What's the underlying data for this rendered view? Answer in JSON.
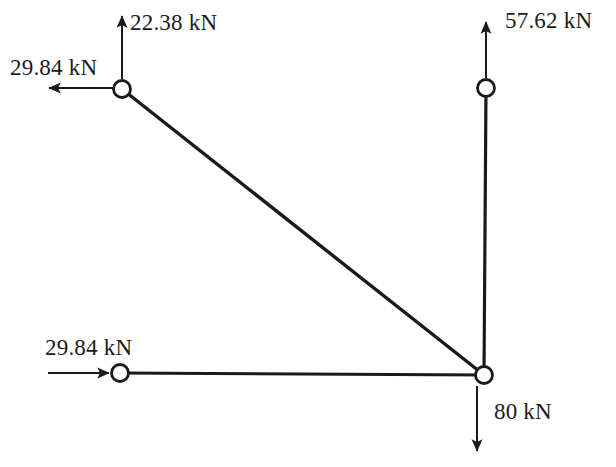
{
  "diagram": {
    "units": "kN",
    "stroke_color": "#1a1a1a",
    "background_color": "#ffffff",
    "nodes": [
      {
        "id": "top-left",
        "label": "top-left joint",
        "x": 122,
        "y": 89,
        "r": 8.5
      },
      {
        "id": "top-right",
        "label": "top-right joint",
        "x": 486,
        "y": 88,
        "r": 8.5
      },
      {
        "id": "bottom-left",
        "label": "bottom-left joint",
        "x": 120,
        "y": 373,
        "r": 8.5
      },
      {
        "id": "bottom-right",
        "label": "bottom-right joint",
        "x": 484,
        "y": 375,
        "r": 8.5
      }
    ],
    "members": [
      {
        "id": "diagonal",
        "from": "top-left",
        "to": "bottom-right"
      },
      {
        "id": "vertical-right",
        "from": "top-right",
        "to": "bottom-right"
      },
      {
        "id": "bottom-chord",
        "from": "bottom-left",
        "to": "bottom-right"
      }
    ],
    "forces": [
      {
        "id": "force-top-left-up",
        "value": "22.38 kN",
        "magnitude": 22.38,
        "direction": "up",
        "at_node": "top-left",
        "label_x": 130,
        "label_y": 30
      },
      {
        "id": "force-top-left-left",
        "value": "29.84 kN",
        "magnitude": 29.84,
        "direction": "left",
        "at_node": "top-left",
        "label_x": 10,
        "label_y": 75
      },
      {
        "id": "force-top-right-up",
        "value": "57.62 kN",
        "magnitude": 57.62,
        "direction": "up",
        "at_node": "top-right",
        "label_x": 505,
        "label_y": 28
      },
      {
        "id": "force-bottom-left-right",
        "value": "29.84 kN",
        "magnitude": 29.84,
        "direction": "right",
        "at_node": "bottom-left",
        "label_x": 45,
        "label_y": 355
      },
      {
        "id": "force-bottom-right-down",
        "value": "80 kN",
        "magnitude": 80,
        "direction": "down",
        "at_node": "bottom-right",
        "label_x": 494,
        "label_y": 419
      }
    ]
  }
}
